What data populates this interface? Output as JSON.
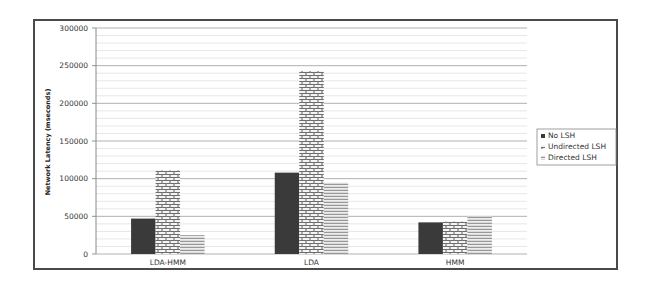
{
  "chart_data": {
    "type": "bar",
    "title": "",
    "xlabel": "",
    "ylabel": "Network Latency (mseconds)",
    "ylim": [
      0,
      300000
    ],
    "yticks": [
      0,
      50000,
      100000,
      150000,
      200000,
      250000,
      300000
    ],
    "ytick_labels": [
      "0",
      "50000",
      "100000",
      "150000",
      "200000",
      "250000",
      "300000"
    ],
    "minor_grid_step": 10000,
    "grid": true,
    "legend_position": "right",
    "categories": [
      "LDA-HMM",
      "LDA",
      "HMM"
    ],
    "series": [
      {
        "name": "No LSH",
        "pattern": "solid-dark",
        "color": "#3a3a3a",
        "values": [
          47000,
          108000,
          42000
        ]
      },
      {
        "name": "Undirected LSH",
        "pattern": "brick",
        "color": "#888888",
        "values": [
          111000,
          243000,
          43000
        ]
      },
      {
        "name": "Directed LSH",
        "pattern": "zigzag",
        "color": "#9a9a9a",
        "values": [
          25000,
          95000,
          50000
        ]
      }
    ]
  }
}
